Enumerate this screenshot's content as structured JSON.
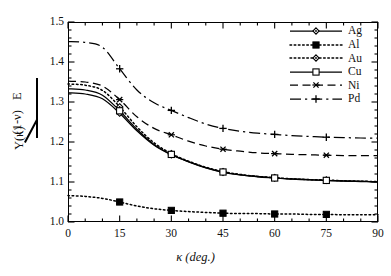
{
  "chart_data": {
    "type": "line",
    "title": "",
    "subtitle": "",
    "xlabel": "κ (deg.)",
    "ylabel": "Y(κ)/[E/(1-ν)]",
    "ylabel_parts": {
      "numerator": "Y(κ)",
      "denominator_top": "E",
      "denominator_bottom": "(1-ν)"
    },
    "xlim": [
      0,
      90
    ],
    "ylim": [
      1.0,
      1.5
    ],
    "xticks": [
      0,
      15,
      30,
      45,
      60,
      75,
      90
    ],
    "xtick_labels": [
      "0",
      "15",
      "30",
      "45",
      "60",
      "75",
      "90"
    ],
    "yticks": [
      1.0,
      1.1,
      1.2,
      1.3,
      1.4,
      1.5
    ],
    "ytick_labels": [
      "1.0",
      "1.1",
      "1.2",
      "1.3",
      "1.4",
      "1.5"
    ],
    "x_minor_interval": 5,
    "y_minor_interval": 0.02,
    "grid": false,
    "legend_position": "top-right",
    "x": [
      0,
      5,
      10,
      15,
      20,
      25,
      30,
      35,
      40,
      45,
      50,
      55,
      60,
      65,
      70,
      75,
      80,
      85,
      90
    ],
    "series": [
      {
        "name": "Ag",
        "marker": "diamond-open",
        "linestyle": "solid",
        "color": "#000000",
        "marker_x": [
          15,
          30,
          45,
          60,
          75
        ],
        "values": [
          1.323,
          1.32,
          1.308,
          1.272,
          1.228,
          1.192,
          1.168,
          1.15,
          1.135,
          1.124,
          1.118,
          1.113,
          1.11,
          1.107,
          1.105,
          1.104,
          1.102,
          1.101,
          1.1
        ]
      },
      {
        "name": "Al",
        "marker": "square-filled",
        "linestyle": "dotted",
        "color": "#000000",
        "marker_x": [
          15,
          30,
          45,
          60,
          75
        ],
        "values": [
          1.066,
          1.064,
          1.059,
          1.05,
          1.04,
          1.033,
          1.029,
          1.026,
          1.024,
          1.022,
          1.021,
          1.021,
          1.02,
          1.02,
          1.019,
          1.019,
          1.018,
          1.018,
          1.018
        ]
      },
      {
        "name": "Au",
        "marker": "diamond-open",
        "linestyle": "dotted",
        "color": "#000000",
        "marker_x": [
          15,
          30,
          45,
          60,
          75
        ],
        "values": [
          1.345,
          1.342,
          1.329,
          1.288,
          1.238,
          1.198,
          1.171,
          1.152,
          1.137,
          1.126,
          1.119,
          1.114,
          1.111,
          1.108,
          1.106,
          1.105,
          1.103,
          1.102,
          1.101
        ]
      },
      {
        "name": "Cu",
        "marker": "square-open",
        "linestyle": "solid",
        "color": "#000000",
        "marker_x": [
          15,
          30,
          45,
          60,
          75
        ],
        "values": [
          1.333,
          1.33,
          1.317,
          1.278,
          1.232,
          1.194,
          1.169,
          1.151,
          1.136,
          1.125,
          1.118,
          1.114,
          1.11,
          1.108,
          1.106,
          1.104,
          1.103,
          1.102,
          1.1
        ]
      },
      {
        "name": "Ni",
        "marker": "asterisk",
        "linestyle": "dashed",
        "color": "#000000",
        "marker_x": [
          15,
          30,
          45,
          60,
          75
        ],
        "values": [
          1.352,
          1.35,
          1.34,
          1.306,
          1.263,
          1.234,
          1.218,
          1.202,
          1.19,
          1.182,
          1.177,
          1.173,
          1.171,
          1.169,
          1.168,
          1.167,
          1.166,
          1.166,
          1.166
        ]
      },
      {
        "name": "Pd",
        "marker": "plus",
        "linestyle": "dashdot",
        "color": "#000000",
        "marker_x": [
          15,
          30,
          45,
          60,
          75
        ],
        "values": [
          1.451,
          1.449,
          1.437,
          1.383,
          1.33,
          1.298,
          1.279,
          1.261,
          1.245,
          1.234,
          1.227,
          1.222,
          1.219,
          1.216,
          1.214,
          1.212,
          1.211,
          1.21,
          1.21
        ]
      }
    ]
  },
  "legend": {
    "entries": [
      {
        "label": "Ag"
      },
      {
        "label": "Al"
      },
      {
        "label": "Au"
      },
      {
        "label": "Cu"
      },
      {
        "label": "Ni"
      },
      {
        "label": "Pd"
      }
    ]
  }
}
